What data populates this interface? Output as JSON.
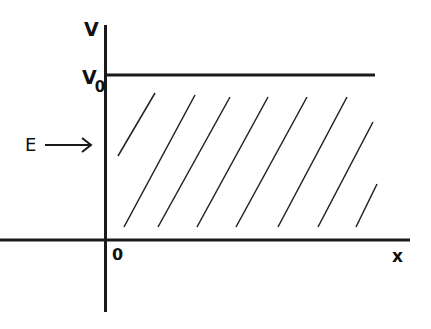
{
  "diagram": {
    "type": "potential-step",
    "labels": {
      "y_axis": "V",
      "v0": "V",
      "v0_sub": "0",
      "energy": "E",
      "origin": "0",
      "x_axis": "x"
    },
    "colors": {
      "background": "#ffffff",
      "ink": "#1a1a1a"
    },
    "shading": "diagonal hatch region between x-axis and V0 for x > 0",
    "hatch_lines": [
      [
        118,
        156,
        155,
        93
      ],
      [
        124,
        227,
        195,
        95
      ],
      [
        158,
        227,
        230,
        97
      ],
      [
        197,
        227,
        268,
        97
      ],
      [
        236,
        227,
        307,
        97
      ],
      [
        278,
        227,
        347,
        97
      ],
      [
        318,
        227,
        373,
        122
      ],
      [
        356,
        227,
        377,
        184
      ]
    ]
  }
}
